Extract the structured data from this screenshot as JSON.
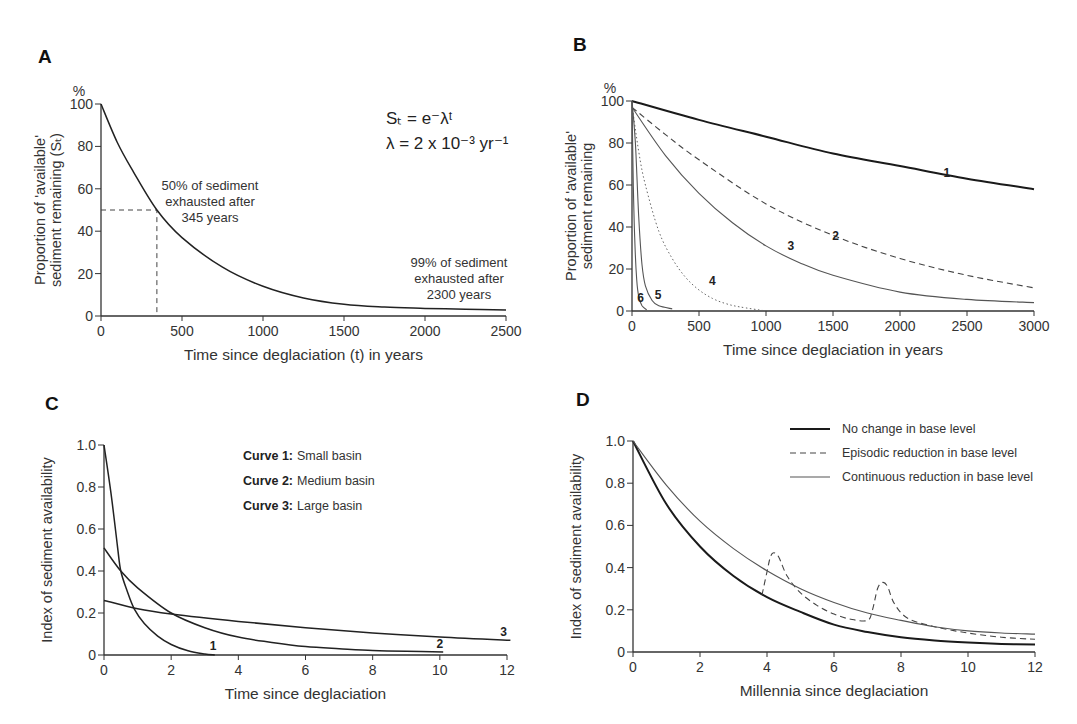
{
  "chart_data": [
    {
      "id": "A",
      "type": "line",
      "panel_label": "A",
      "title": "",
      "xlabel": "Time since deglaciation (t) in years",
      "ylabel_lines": [
        "Proportion of 'available'",
        "sediment remaining (Sₜ)"
      ],
      "y_unit": "%",
      "xlim": [
        0,
        2500
      ],
      "ylim": [
        0,
        100
      ],
      "xticks": [
        0,
        500,
        1000,
        1500,
        2000,
        2500
      ],
      "yticks": [
        0,
        20,
        40,
        60,
        80,
        100
      ],
      "formula_lines": [
        "Sₜ = e⁻λᵗ",
        "λ  = 2 x 10⁻³ yr⁻¹"
      ],
      "annotations": [
        {
          "text_lines": [
            "50% of sediment",
            "exhausted after",
            "345 years"
          ]
        },
        {
          "text_lines": [
            "99% of sediment",
            "exhausted after",
            "2300 years"
          ]
        }
      ],
      "guide": {
        "x": 345,
        "y": 50,
        "style": "dashed"
      },
      "series": [
        {
          "name": "S_t",
          "style": "solid",
          "x": [
            0,
            100,
            200,
            345,
            500,
            750,
            1000,
            1250,
            1500,
            1750,
            2000,
            2250,
            2500
          ],
          "values": [
            100,
            82,
            68,
            50,
            37,
            23,
            14,
            8.5,
            5.5,
            4.2,
            3.6,
            3.2,
            2.8
          ]
        }
      ]
    },
    {
      "id": "B",
      "type": "line",
      "panel_label": "B",
      "title": "",
      "xlabel": "Time since deglaciation in years",
      "ylabel_lines": [
        "Proportion of 'available'",
        "sediment remaining"
      ],
      "y_unit": "%",
      "xlim": [
        0,
        3000
      ],
      "ylim": [
        0,
        100
      ],
      "xticks": [
        0,
        500,
        1000,
        1500,
        2000,
        2500,
        3000
      ],
      "yticks": [
        0,
        20,
        40,
        60,
        80,
        100
      ],
      "series": [
        {
          "name": "1",
          "style": "solid-thick",
          "x": [
            0,
            500,
            1000,
            1500,
            2000,
            2500,
            3000
          ],
          "values": [
            100,
            91,
            83,
            75,
            69,
            63,
            58
          ]
        },
        {
          "name": "2",
          "style": "dashed",
          "x": [
            0,
            250,
            500,
            1000,
            1500,
            2000,
            2500,
            3000
          ],
          "values": [
            97,
            84,
            72,
            51,
            36,
            25,
            17,
            11
          ]
        },
        {
          "name": "3",
          "style": "solid-thin",
          "x": [
            0,
            250,
            500,
            750,
            1000,
            1250,
            1500,
            2000,
            2500,
            3000
          ],
          "values": [
            97,
            74,
            56,
            42,
            31,
            23,
            17,
            9,
            5.5,
            4
          ]
        },
        {
          "name": "4",
          "style": "dotted",
          "x": [
            0,
            50,
            100,
            200,
            300,
            400,
            500,
            600,
            700,
            800,
            1000
          ],
          "values": [
            98,
            76,
            60,
            38,
            25,
            16,
            10,
            6,
            3.5,
            2,
            0
          ]
        },
        {
          "name": "5",
          "style": "solid-thin",
          "x": [
            0,
            25,
            50,
            75,
            100,
            150,
            200,
            300
          ],
          "values": [
            100,
            80,
            45,
            22,
            12,
            5,
            2.5,
            1
          ]
        },
        {
          "name": "6",
          "style": "solid-thin",
          "x": [
            0,
            10,
            20,
            35,
            50,
            75,
            110
          ],
          "values": [
            100,
            60,
            35,
            15,
            7,
            2.5,
            0.5
          ]
        }
      ],
      "curve_labels": [
        {
          "text": "1",
          "x": 2350,
          "y": 64
        },
        {
          "text": "2",
          "x": 1520,
          "y": 34
        },
        {
          "text": "3",
          "x": 1185,
          "y": 29
        },
        {
          "text": "4",
          "x": 600,
          "y": 12.5
        },
        {
          "text": "5",
          "x": 195,
          "y": 5.5
        },
        {
          "text": "6",
          "x": 65,
          "y": 4.5
        }
      ]
    },
    {
      "id": "C",
      "type": "line",
      "panel_label": "C",
      "title": "",
      "xlabel": "Time since deglaciation",
      "ylabel": "Index of sediment availability",
      "xlim": [
        0,
        12
      ],
      "ylim": [
        0,
        1.0
      ],
      "xticks": [
        0,
        2,
        4,
        6,
        8,
        10,
        12
      ],
      "yticks": [
        "0",
        "0.2",
        "0.4",
        "0.6",
        "0.8",
        "1.0"
      ],
      "legend": [
        {
          "key": "Curve 1:",
          "value": "Small basin"
        },
        {
          "key": "Curve 2:",
          "value": "Medium basin"
        },
        {
          "key": "Curve 3:",
          "value": "Large basin"
        }
      ],
      "series": [
        {
          "name": "1",
          "x": [
            0,
            0.2,
            0.4,
            0.5,
            0.7,
            0.9,
            1.2,
            1.6,
            2.0,
            2.5,
            3.0,
            3.3
          ],
          "values": [
            1.0,
            0.78,
            0.52,
            0.4,
            0.3,
            0.22,
            0.15,
            0.09,
            0.05,
            0.02,
            0.005,
            0.0
          ]
        },
        {
          "name": "2",
          "x": [
            0,
            0.5,
            1,
            2,
            3,
            4,
            5,
            6,
            7,
            8,
            9,
            10.1
          ],
          "values": [
            0.51,
            0.4,
            0.32,
            0.2,
            0.13,
            0.085,
            0.06,
            0.04,
            0.03,
            0.022,
            0.018,
            0.015
          ]
        },
        {
          "name": "3",
          "x": [
            0,
            1,
            2,
            4,
            6,
            8,
            10,
            12.1
          ],
          "values": [
            0.26,
            0.22,
            0.195,
            0.16,
            0.13,
            0.105,
            0.085,
            0.07
          ]
        }
      ],
      "curve_labels": [
        {
          "text": "1",
          "x": 3.25,
          "y": 0.025
        },
        {
          "text": "2",
          "x": 10.0,
          "y": 0.035
        },
        {
          "text": "3",
          "x": 11.9,
          "y": 0.09
        }
      ]
    },
    {
      "id": "D",
      "type": "line",
      "panel_label": "D",
      "title": "",
      "xlabel": "Millennia since deglaciation",
      "ylabel": "Index of sediment availability",
      "xlim": [
        0,
        12
      ],
      "ylim": [
        0,
        1.0
      ],
      "xticks": [
        0,
        2,
        4,
        6,
        8,
        10,
        12
      ],
      "yticks": [
        "0",
        "0.2",
        "0.4",
        "0.6",
        "0.8",
        "1.0"
      ],
      "legend": [
        {
          "label": "No change in base level",
          "style": "solid-thick"
        },
        {
          "label": "Episodic reduction in base level",
          "style": "dashed"
        },
        {
          "label": "Continuous reduction in base level",
          "style": "solid-thin"
        }
      ],
      "series": [
        {
          "name": "No change in base level",
          "x": [
            0,
            1,
            2,
            3,
            4,
            5,
            6,
            7,
            8,
            9,
            10,
            11,
            12
          ],
          "values": [
            1.0,
            0.7,
            0.5,
            0.36,
            0.26,
            0.19,
            0.13,
            0.095,
            0.07,
            0.055,
            0.045,
            0.038,
            0.035
          ]
        },
        {
          "name": "Episodic reduction in base level",
          "x": [
            3.85,
            4.0,
            4.1,
            4.2,
            4.35,
            4.6,
            5.0,
            5.5,
            6.0,
            6.5,
            7.0,
            7.15,
            7.3,
            7.45,
            7.6,
            7.8,
            8.2,
            9.0,
            10.0,
            11.0,
            12.0
          ],
          "values": [
            0.27,
            0.38,
            0.45,
            0.47,
            0.45,
            0.36,
            0.28,
            0.22,
            0.18,
            0.155,
            0.15,
            0.2,
            0.3,
            0.33,
            0.31,
            0.23,
            0.16,
            0.12,
            0.09,
            0.07,
            0.06
          ]
        },
        {
          "name": "Continuous reduction in base level",
          "x": [
            0,
            1,
            2,
            3,
            4,
            5,
            6,
            7,
            8,
            9,
            10,
            11,
            12
          ],
          "values": [
            1.0,
            0.79,
            0.62,
            0.49,
            0.385,
            0.3,
            0.235,
            0.185,
            0.15,
            0.12,
            0.1,
            0.09,
            0.085
          ]
        }
      ]
    }
  ]
}
